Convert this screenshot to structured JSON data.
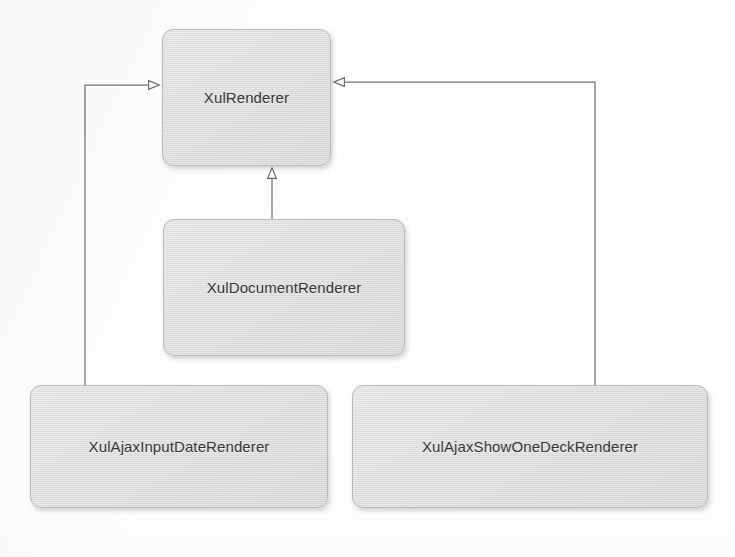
{
  "diagram": {
    "kind": "uml-class-diagram",
    "relationship_type": "generalization",
    "background_color": "#fefefe",
    "box_fill_color": "#dedede",
    "box_border_color": "#b9b9b9",
    "connector_color": "#6f6f6f",
    "text_color": "#36373a",
    "classes": [
      {
        "id": "xul-renderer",
        "name": "XulRenderer",
        "role": "superclass"
      },
      {
        "id": "xul-document",
        "name": "XulDocumentRenderer",
        "role": "subclass"
      },
      {
        "id": "xul-ajax-input",
        "name": "XulAjaxInputDateRenderer",
        "role": "subclass"
      },
      {
        "id": "xul-ajax-showone",
        "name": "XulAjaxShowOneDeckRenderer",
        "role": "subclass"
      }
    ],
    "connectors": [
      {
        "id": "gen-document",
        "from": "XulDocumentRenderer",
        "to": "XulRenderer",
        "arrowhead": "hollow-triangle",
        "enters_edge": "bottom"
      },
      {
        "id": "gen-ajax-input",
        "from": "XulAjaxInputDateRenderer",
        "to": "XulRenderer",
        "arrowhead": "hollow-triangle",
        "enters_edge": "left"
      },
      {
        "id": "gen-ajax-showone",
        "from": "XulAjaxShowOneDeckRenderer",
        "to": "XulRenderer",
        "arrowhead": "hollow-triangle",
        "enters_edge": "right"
      }
    ]
  }
}
